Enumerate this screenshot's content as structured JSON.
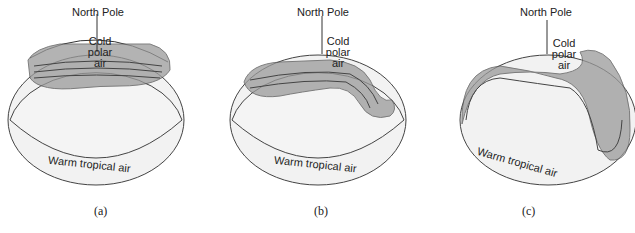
{
  "figure": {
    "panels": [
      {
        "id": "a",
        "caption": "(a)",
        "north_pole_label": "North Pole",
        "cold_label": [
          "Cold",
          "polar",
          "air"
        ],
        "warm_label": "Warm tropical air"
      },
      {
        "id": "b",
        "caption": "(b)",
        "north_pole_label": "North Pole",
        "cold_label": [
          "Cold",
          "polar",
          "air"
        ],
        "warm_label": "Warm tropical air"
      },
      {
        "id": "c",
        "caption": "(c)",
        "north_pole_label": "North Pole",
        "cold_label": [
          "Cold",
          "polar",
          "air"
        ],
        "warm_label": "Warm tropical air"
      }
    ],
    "colors": {
      "band": "#8a8a8a",
      "band_light": "#cfcfcf",
      "globe": "#f2f2f2",
      "outline": "#333333"
    }
  }
}
